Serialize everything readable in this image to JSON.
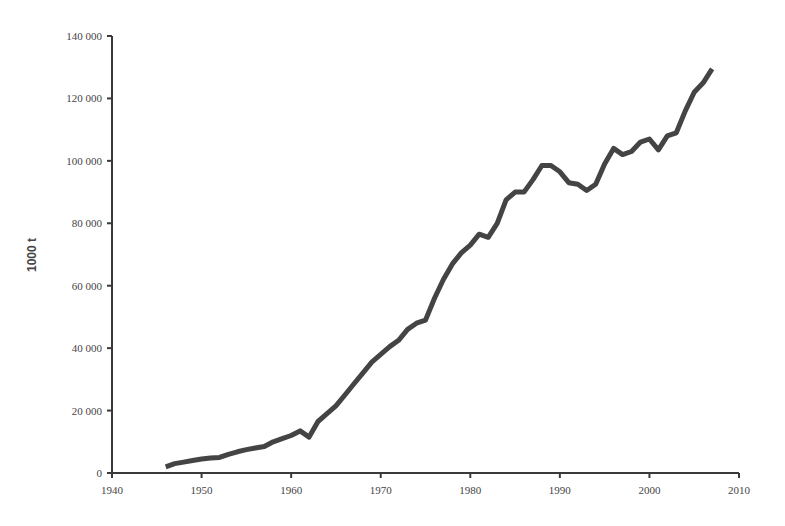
{
  "chart_data": {
    "type": "line",
    "title": "",
    "xlabel": "",
    "ylabel": "1000 t",
    "xlim": [
      1940,
      2010
    ],
    "ylim": [
      0,
      140000
    ],
    "grid": false,
    "legend": null,
    "x_ticks": [
      1940,
      1950,
      1960,
      1970,
      1980,
      1990,
      2000,
      2010
    ],
    "x_tick_labels": [
      "1940",
      "1950",
      "1960",
      "1970",
      "1980",
      "1990",
      "2000",
      "2010"
    ],
    "y_ticks": [
      0,
      20000,
      40000,
      60000,
      80000,
      100000,
      120000,
      140000
    ],
    "y_tick_labels": [
      "0",
      "20 000",
      "40 000",
      "60 000",
      "80 000",
      "100 000",
      "120 000",
      "140 000"
    ],
    "line_color": "#444444",
    "series": [
      {
        "name": "Production",
        "x": [
          1946,
          1947,
          1948,
          1949,
          1950,
          1951,
          1952,
          1953,
          1954,
          1955,
          1956,
          1957,
          1958,
          1959,
          1960,
          1961,
          1962,
          1963,
          1964,
          1965,
          1966,
          1967,
          1968,
          1969,
          1970,
          1971,
          1972,
          1973,
          1974,
          1975,
          1976,
          1977,
          1978,
          1979,
          1980,
          1981,
          1982,
          1983,
          1984,
          1985,
          1986,
          1987,
          1988,
          1989,
          1990,
          1991,
          1992,
          1993,
          1994,
          1995,
          1996,
          1997,
          1998,
          1999,
          2000,
          2001,
          2002,
          2003,
          2004,
          2005,
          2006,
          2007
        ],
        "values": [
          2000,
          3000,
          3500,
          4000,
          4500,
          4800,
          5000,
          6000,
          6800,
          7500,
          8000,
          8500,
          10000,
          11000,
          12000,
          13500,
          11500,
          16500,
          19000,
          21500,
          25000,
          28500,
          32000,
          35500,
          38000,
          40500,
          42500,
          46000,
          48000,
          49000,
          56000,
          62000,
          67000,
          70500,
          73000,
          76500,
          75500,
          80000,
          87500,
          90000,
          90000,
          94000,
          98500,
          98500,
          96500,
          93000,
          92500,
          90500,
          92500,
          99000,
          104000,
          102000,
          103000,
          106000,
          107000,
          103500,
          108000,
          109000,
          116000,
          122000,
          125000,
          129500
        ]
      }
    ]
  }
}
